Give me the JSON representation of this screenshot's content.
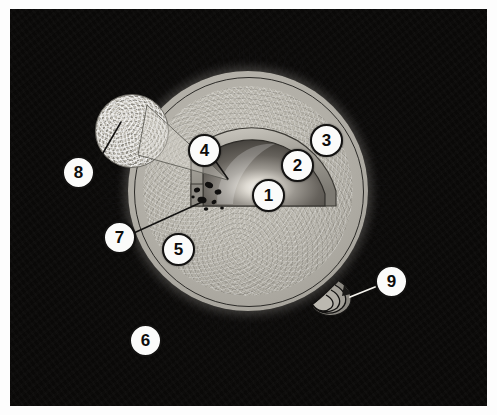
{
  "figure": {
    "kind": "labeled-micrograph-diagram",
    "rendering": "grayscale",
    "plate": {
      "background_color": "#0a0908",
      "margin_color": "#fdfdfd",
      "x": 10,
      "y": 9,
      "width": 477,
      "height": 397
    },
    "palette": {
      "plate_black": "#0a0908",
      "corona_spikes": "#111010",
      "halo_gray": "#b2afa7",
      "ooplasm_gray": "#bab7ae",
      "nucleus_dark": "#4d4a45",
      "nucleus_highlight": "#f4f2ec",
      "outline_black": "#2b2a27",
      "callout_fill": "#fbfbfa",
      "callout_border": "#131211",
      "leader_line": "#121110",
      "granule_black": "#100f0e"
    }
  },
  "callouts": [
    {
      "id": "1",
      "label": "1",
      "x": 252,
      "y": 179,
      "target_x": 262,
      "target_y": 196,
      "has_leader": false,
      "points_at": "nucleus-highlight-center"
    },
    {
      "id": "2",
      "label": "2",
      "x": 281,
      "y": 149,
      "target_x": 292,
      "target_y": 166,
      "has_leader": false,
      "points_at": "nucleus-body"
    },
    {
      "id": "3",
      "label": "3",
      "x": 310,
      "y": 124,
      "target_x": 321,
      "target_y": 141,
      "has_leader": false,
      "points_at": "nuclear-envelope-rim"
    },
    {
      "id": "4",
      "label": "4",
      "x": 188,
      "y": 134,
      "target_x": 216,
      "target_y": 167,
      "has_leader": true,
      "points_at": "cut-away-wedge-edge"
    },
    {
      "id": "5",
      "label": "5",
      "x": 162,
      "y": 233,
      "target_x": 176,
      "target_y": 247,
      "has_leader": false,
      "points_at": "ooplasm-cytoplasm"
    },
    {
      "id": "6",
      "label": "6",
      "x": 129,
      "y": 324,
      "target_x": 143,
      "target_y": 338,
      "has_leader": false,
      "points_at": "corona-radiata-spikes"
    },
    {
      "id": "7",
      "label": "7",
      "x": 103,
      "y": 221,
      "target_x": 193,
      "target_y": 196,
      "has_leader": true,
      "points_at": "cortical-granules-cluster"
    },
    {
      "id": "8",
      "label": "8",
      "x": 62,
      "y": 156,
      "target_x": 121,
      "target_y": 123,
      "has_leader": true,
      "points_at": "magnified-inset-circle"
    },
    {
      "id": "9",
      "label": "9",
      "x": 375,
      "y": 265,
      "target_x": 339,
      "target_y": 288,
      "has_leader": true,
      "points_at": "sperm-head-and-flagellum"
    }
  ],
  "structures": {
    "corona_radiata": {
      "name": "corona-radiata",
      "center_x": 238,
      "center_y": 182,
      "inner_radius": 118,
      "spike_length": 42,
      "spike_count": 150
    },
    "zona_pellucida": {
      "name": "zona-pellucida",
      "center_x": 238,
      "center_y": 182,
      "radius": 114
    },
    "ooplasm": {
      "name": "ooplasm",
      "center_x": 238,
      "center_y": 182,
      "radius": 105
    },
    "nucleus_wedge": {
      "name": "nucleus-cutaway-wedge",
      "center_x": 238,
      "center_y": 182,
      "radius": 88
    },
    "cortical_granules": {
      "name": "cortical-granule-cluster",
      "count": 8,
      "region_x": 183,
      "region_y": 176,
      "region_w": 34,
      "region_h": 32
    },
    "inset_circle": {
      "name": "magnified-inset",
      "center_x": 121,
      "center_y": 121,
      "radius": 36
    },
    "sperm": {
      "name": "sperm-with-flagellum",
      "head_x": 334,
      "head_y": 285,
      "tail_coils": 5
    }
  }
}
